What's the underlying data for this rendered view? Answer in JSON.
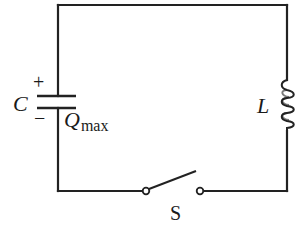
{
  "diagram": {
    "type": "circuit",
    "colors": {
      "wire": "#222222",
      "background": "#ffffff"
    },
    "components": {
      "capacitor": {
        "symbol": "C",
        "charge_label_main": "Q",
        "charge_label_sub": "max",
        "plus_sign": "+",
        "minus_sign": "−"
      },
      "inductor": {
        "symbol": "L"
      },
      "switch": {
        "symbol": "S",
        "state": "open"
      }
    }
  }
}
